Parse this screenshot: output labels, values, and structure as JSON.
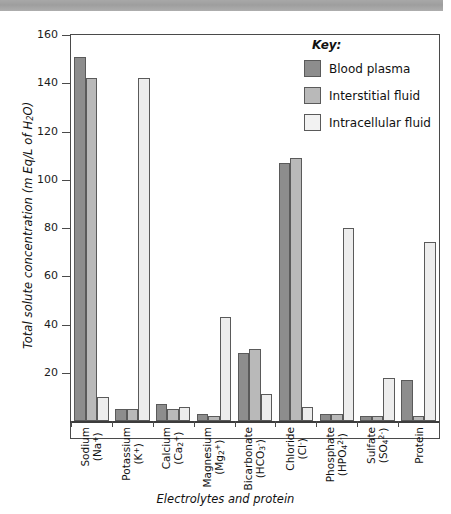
{
  "chart_data": {
    "type": "bar",
    "title": "",
    "xlabel": "Electrolytes and protein",
    "ylabel": "Total solute concentration (m Eq/L of H₂O)",
    "ylim": [
      0,
      160
    ],
    "yticks": [
      0,
      20,
      40,
      60,
      80,
      100,
      120,
      140,
      160
    ],
    "ytick_labels": [
      "",
      "20",
      "40",
      "60",
      "80",
      "100",
      "120",
      "140",
      "160"
    ],
    "grid": false,
    "legend_position": "top-right",
    "legend_title": "Key:",
    "categories": [
      "Sodium (Na⁺)",
      "Potassium (K⁺)",
      "Calcium (Ca²⁺)",
      "Magnesium (Mg²⁺)",
      "Bicarbonate (HCO₃⁻)",
      "Chloride (Cl⁻)",
      "Phosphate (HPO₄²⁻)",
      "Sulfate (SO₄²⁻)",
      "Protein"
    ],
    "category_lines": [
      {
        "name": "Sodium",
        "formula": "(Na+)"
      },
      {
        "name": "Potassium",
        "formula": "(K+)"
      },
      {
        "name": "Calcium",
        "formula": "(Ca2+)"
      },
      {
        "name": "Magnesium",
        "formula": "(Mg2+)"
      },
      {
        "name": "Bicarbonate",
        "formula": "(HCO3-)"
      },
      {
        "name": "Chloride",
        "formula": "(Cl-)"
      },
      {
        "name": "Phosphate",
        "formula": "(HPO42-)"
      },
      {
        "name": "Sulfate",
        "formula": "(SO42-)"
      },
      {
        "name": "Protein",
        "formula": ""
      }
    ],
    "series": [
      {
        "name": "Blood plasma",
        "color": "#8d8d8d",
        "values": [
          151,
          5,
          7,
          3,
          28,
          107,
          3,
          2,
          17
        ]
      },
      {
        "name": "Interstitial fluid",
        "color": "#b9b9b9",
        "values": [
          142,
          5,
          5,
          2,
          30,
          109,
          3,
          2,
          2
        ]
      },
      {
        "name": "Intracellular fluid",
        "color": "#ededed",
        "values": [
          10,
          142,
          6,
          43,
          11,
          6,
          80,
          18,
          74
        ]
      }
    ]
  },
  "legend": {
    "title": "Key:",
    "items": [
      {
        "label": "Blood plasma",
        "swatch": "legend-swatch-blood-plasma"
      },
      {
        "label": "Interstitial fluid",
        "swatch": "legend-swatch-interstitial-fluid"
      },
      {
        "label": "Intracellular fluid",
        "swatch": "legend-swatch-intracellular-fluid"
      }
    ]
  },
  "axes": {
    "y_title": "Total solute concentration (m Eq/L of H₂O)",
    "x_title": "Electrolytes and protein"
  }
}
